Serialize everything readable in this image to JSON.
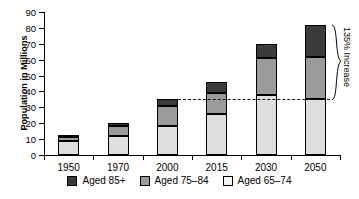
{
  "chart_data": {
    "type": "bar",
    "subtype": "stacked-bar",
    "title": "",
    "xlabel": "",
    "ylabel": "Population in Millions",
    "categories": [
      "1950",
      "1970",
      "2000",
      "2015",
      "2030",
      "2050"
    ],
    "ylim": [
      0,
      90
    ],
    "yticks": [
      0,
      10,
      20,
      30,
      40,
      50,
      60,
      70,
      80,
      90
    ],
    "grid": false,
    "legend_position": "bottom",
    "series": [
      {
        "name": "Aged 65–74",
        "key": "light",
        "color": "#dedede",
        "values": [
          9,
          12,
          18,
          26,
          38,
          35
        ]
      },
      {
        "name": "Aged 75–84",
        "key": "mid",
        "color": "#9b9b9b",
        "values": [
          2.5,
          6.5,
          13,
          13,
          23,
          27
        ]
      },
      {
        "name": "Aged 85+",
        "key": "dark",
        "color": "#3b3b3b",
        "values": [
          1,
          1.5,
          4,
          7,
          9,
          20
        ]
      }
    ],
    "totals": [
      12.5,
      20,
      35,
      46,
      70,
      82
    ],
    "reference_line": {
      "value": 35,
      "style": "dashed",
      "from_category": "2000",
      "to_category": "2050"
    },
    "annotations": [
      {
        "text": "135% Increase",
        "type": "brace",
        "from_value": 35,
        "to_value": 82,
        "at_category": "2050"
      }
    ]
  },
  "legend": {
    "items": [
      {
        "label": "Aged 85+",
        "swatch": "dark"
      },
      {
        "label": "Aged 75–84",
        "swatch": "mid"
      },
      {
        "label": "Aged 65–74",
        "swatch": "light"
      }
    ]
  }
}
